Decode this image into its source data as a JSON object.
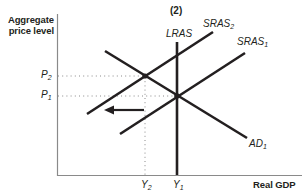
{
  "panel_label": "(2)",
  "axes": {
    "y_title_line1": "Aggregate",
    "y_title_line2": "price level",
    "x_title": "Real GDP"
  },
  "curves": {
    "lras": {
      "label": "LRAS"
    },
    "sras2": {
      "label": "SRAS",
      "sub": "2"
    },
    "sras1": {
      "label": "SRAS",
      "sub": "1"
    },
    "ad1": {
      "label": "AD",
      "sub": "1"
    }
  },
  "ticks": {
    "p2": {
      "label": "P",
      "sub": "2"
    },
    "p1": {
      "label": "P",
      "sub": "1"
    },
    "y2": {
      "label": "Y",
      "sub": "2"
    },
    "y1": {
      "label": "Y",
      "sub": "1"
    }
  },
  "colors": {
    "line": "#231f20",
    "axis": "#808080",
    "dotted": "#808080"
  }
}
